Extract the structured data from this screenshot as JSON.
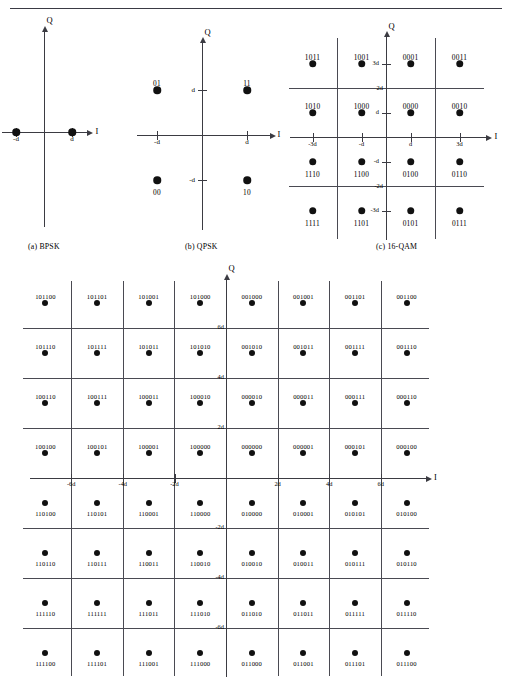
{
  "header": {
    "rule_ghost_text": ""
  },
  "figure": {
    "panels": [
      {
        "id": "bpsk",
        "caption": "(a) BPSK"
      },
      {
        "id": "qpsk",
        "caption": "(b) QPSK"
      },
      {
        "id": "qam16",
        "caption": "(c) 16-QAM"
      },
      {
        "id": "qam64",
        "caption": ""
      }
    ],
    "axis_labels": {
      "i": "I",
      "q": "Q"
    }
  },
  "chart_data": [
    {
      "type": "scatter",
      "name": "BPSK",
      "title": "(a) BPSK",
      "xlabel": "I",
      "ylabel": "Q",
      "grid": false,
      "xlim": [
        -2,
        2
      ],
      "ylim": [
        -2,
        2
      ],
      "xticks": [
        -1,
        1
      ],
      "xticklabels": [
        "-d",
        "d"
      ],
      "yticks": [],
      "yticklabels": [],
      "points": [
        {
          "x": -1,
          "y": 0,
          "label": ""
        },
        {
          "x": 1,
          "y": 0,
          "label": ""
        }
      ]
    },
    {
      "type": "scatter",
      "name": "QPSK",
      "title": "(b) QPSK",
      "xlabel": "I",
      "ylabel": "Q",
      "grid": false,
      "xlim": [
        -2,
        2
      ],
      "ylim": [
        -2,
        2
      ],
      "xticks": [
        -1,
        1
      ],
      "xticklabels": [
        "-d",
        "d"
      ],
      "yticks": [
        -1,
        1
      ],
      "yticklabels": [
        "-d",
        "d"
      ],
      "points": [
        {
          "x": -1,
          "y": 1,
          "label": "01"
        },
        {
          "x": 1,
          "y": 1,
          "label": "11"
        },
        {
          "x": -1,
          "y": -1,
          "label": "00"
        },
        {
          "x": 1,
          "y": -1,
          "label": "10"
        }
      ]
    },
    {
      "type": "scatter",
      "name": "16-QAM",
      "title": "(c) 16-QAM",
      "xlabel": "I",
      "ylabel": "Q",
      "grid": true,
      "gridlines_x": [
        -2,
        2
      ],
      "gridlines_x_labels": [
        "-2d",
        "2d"
      ],
      "gridlines_y": [
        -2,
        2
      ],
      "gridlines_y_labels": [
        "-2d",
        "2d"
      ],
      "xlim": [
        -4,
        4
      ],
      "ylim": [
        -4,
        4
      ],
      "xticks": [
        -3,
        -1,
        1,
        3
      ],
      "xticklabels": [
        "-3d",
        "-d",
        "d",
        "3d"
      ],
      "yticks": [
        -3,
        -1,
        1,
        3
      ],
      "yticklabels": [
        "-3d",
        "-d",
        "d",
        "3d"
      ],
      "points": [
        {
          "x": -3,
          "y": 3,
          "label": "1011"
        },
        {
          "x": -1,
          "y": 3,
          "label": "1001"
        },
        {
          "x": 1,
          "y": 3,
          "label": "0001"
        },
        {
          "x": 3,
          "y": 3,
          "label": "0011"
        },
        {
          "x": -3,
          "y": 1,
          "label": "1010"
        },
        {
          "x": -1,
          "y": 1,
          "label": "1000"
        },
        {
          "x": 1,
          "y": 1,
          "label": "0000"
        },
        {
          "x": 3,
          "y": 1,
          "label": "0010"
        },
        {
          "x": -3,
          "y": -1,
          "label": "1110"
        },
        {
          "x": -1,
          "y": -1,
          "label": "1100"
        },
        {
          "x": 1,
          "y": -1,
          "label": "0100"
        },
        {
          "x": 3,
          "y": -1,
          "label": "0110"
        },
        {
          "x": -3,
          "y": -3,
          "label": "1111"
        },
        {
          "x": -1,
          "y": -3,
          "label": "1101"
        },
        {
          "x": 1,
          "y": -3,
          "label": "0101"
        },
        {
          "x": 3,
          "y": -3,
          "label": "0111"
        }
      ]
    },
    {
      "type": "scatter",
      "name": "64-QAM",
      "title": "",
      "xlabel": "I",
      "ylabel": "Q",
      "grid": true,
      "gridlines_x": [
        -6,
        -4,
        -2,
        2,
        4,
        6
      ],
      "gridlines_x_labels": [
        "-6d",
        "-4d",
        "-2d",
        "2d",
        "4d",
        "6d"
      ],
      "gridlines_y": [
        -6,
        -4,
        -2,
        2,
        4,
        6
      ],
      "gridlines_y_labels": [
        "-6d",
        "-4d",
        "-2d",
        "2d",
        "4d",
        "6d"
      ],
      "xlim": [
        -8,
        8
      ],
      "ylim": [
        -8,
        8
      ],
      "xticks": [
        -6,
        -4,
        -2,
        2,
        4,
        6
      ],
      "xticklabels": [
        "-6d",
        "-4d",
        "-2d",
        "2d",
        "4d",
        "6d"
      ],
      "yticks": [
        -6,
        -4,
        -2,
        2,
        4,
        6
      ],
      "yticklabels": [
        "-6d",
        "-4d",
        "-2d",
        "2d",
        "4d",
        "6d"
      ],
      "points": [
        {
          "x": -7,
          "y": 7,
          "label": "101100"
        },
        {
          "x": -5,
          "y": 7,
          "label": "101101"
        },
        {
          "x": -3,
          "y": 7,
          "label": "101001"
        },
        {
          "x": -1,
          "y": 7,
          "label": "101000"
        },
        {
          "x": 1,
          "y": 7,
          "label": "001000"
        },
        {
          "x": 3,
          "y": 7,
          "label": "001001"
        },
        {
          "x": 5,
          "y": 7,
          "label": "001101"
        },
        {
          "x": 7,
          "y": 7,
          "label": "001100"
        },
        {
          "x": -7,
          "y": 5,
          "label": "101110"
        },
        {
          "x": -5,
          "y": 5,
          "label": "101111"
        },
        {
          "x": -3,
          "y": 5,
          "label": "101011"
        },
        {
          "x": -1,
          "y": 5,
          "label": "101010"
        },
        {
          "x": 1,
          "y": 5,
          "label": "001010"
        },
        {
          "x": 3,
          "y": 5,
          "label": "001011"
        },
        {
          "x": 5,
          "y": 5,
          "label": "001111"
        },
        {
          "x": 7,
          "y": 5,
          "label": "001110"
        },
        {
          "x": -7,
          "y": 3,
          "label": "100110"
        },
        {
          "x": -5,
          "y": 3,
          "label": "100111"
        },
        {
          "x": -3,
          "y": 3,
          "label": "100011"
        },
        {
          "x": -1,
          "y": 3,
          "label": "100010"
        },
        {
          "x": 1,
          "y": 3,
          "label": "000010"
        },
        {
          "x": 3,
          "y": 3,
          "label": "000011"
        },
        {
          "x": 5,
          "y": 3,
          "label": "000111"
        },
        {
          "x": 7,
          "y": 3,
          "label": "000110"
        },
        {
          "x": -7,
          "y": 1,
          "label": "100100"
        },
        {
          "x": -5,
          "y": 1,
          "label": "100101"
        },
        {
          "x": -3,
          "y": 1,
          "label": "100001"
        },
        {
          "x": -1,
          "y": 1,
          "label": "100000"
        },
        {
          "x": 1,
          "y": 1,
          "label": "000000"
        },
        {
          "x": 3,
          "y": 1,
          "label": "000001"
        },
        {
          "x": 5,
          "y": 1,
          "label": "000101"
        },
        {
          "x": 7,
          "y": 1,
          "label": "000100"
        },
        {
          "x": -7,
          "y": -1,
          "label": "110100"
        },
        {
          "x": -5,
          "y": -1,
          "label": "110101"
        },
        {
          "x": -3,
          "y": -1,
          "label": "110001"
        },
        {
          "x": -1,
          "y": -1,
          "label": "110000"
        },
        {
          "x": 1,
          "y": -1,
          "label": "010000"
        },
        {
          "x": 3,
          "y": -1,
          "label": "010001"
        },
        {
          "x": 5,
          "y": -1,
          "label": "010101"
        },
        {
          "x": 7,
          "y": -1,
          "label": "010100"
        },
        {
          "x": -7,
          "y": -3,
          "label": "110110"
        },
        {
          "x": -5,
          "y": -3,
          "label": "110111"
        },
        {
          "x": -3,
          "y": -3,
          "label": "110011"
        },
        {
          "x": -1,
          "y": -3,
          "label": "110010"
        },
        {
          "x": 1,
          "y": -3,
          "label": "010010"
        },
        {
          "x": 3,
          "y": -3,
          "label": "010011"
        },
        {
          "x": 5,
          "y": -3,
          "label": "010111"
        },
        {
          "x": 7,
          "y": -3,
          "label": "010110"
        },
        {
          "x": -7,
          "y": -5,
          "label": "111110"
        },
        {
          "x": -5,
          "y": -5,
          "label": "111111"
        },
        {
          "x": -3,
          "y": -5,
          "label": "111011"
        },
        {
          "x": -1,
          "y": -5,
          "label": "111010"
        },
        {
          "x": 1,
          "y": -5,
          "label": "011010"
        },
        {
          "x": 3,
          "y": -5,
          "label": "011011"
        },
        {
          "x": 5,
          "y": -5,
          "label": "011111"
        },
        {
          "x": 7,
          "y": -5,
          "label": "011110"
        },
        {
          "x": -7,
          "y": -7,
          "label": "111100"
        },
        {
          "x": -5,
          "y": -7,
          "label": "111101"
        },
        {
          "x": -3,
          "y": -7,
          "label": "111001"
        },
        {
          "x": -1,
          "y": -7,
          "label": "111000"
        },
        {
          "x": 1,
          "y": -7,
          "label": "011000"
        },
        {
          "x": 3,
          "y": -7,
          "label": "011001"
        },
        {
          "x": 5,
          "y": -7,
          "label": "011101"
        },
        {
          "x": 7,
          "y": -7,
          "label": "011100"
        }
      ]
    }
  ],
  "colors": {
    "ink": "#111111",
    "axis": "#3b3b42",
    "grid": "#4a4a52",
    "background": "#ffffff"
  }
}
